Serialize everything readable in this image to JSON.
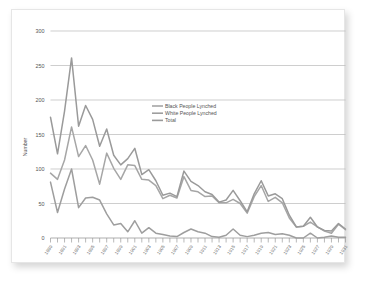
{
  "chart_data": {
    "type": "line",
    "title": "",
    "xlabel": "",
    "ylabel": "Number",
    "ylim": [
      0,
      300
    ],
    "yticks": [
      0,
      50,
      100,
      150,
      200,
      250,
      300
    ],
    "grid": true,
    "legend_position": "upper-center",
    "x": [
      1889,
      1890,
      1891,
      1892,
      1893,
      1894,
      1895,
      1896,
      1897,
      1898,
      1899,
      1900,
      1901,
      1902,
      1903,
      1904,
      1905,
      1906,
      1907,
      1908,
      1909,
      1910,
      1911,
      1912,
      1913,
      1914,
      1915,
      1916,
      1917,
      1918,
      1919,
      1920,
      1921,
      1922,
      1923,
      1924,
      1925,
      1926,
      1927,
      1928,
      1929,
      1930,
      1931
    ],
    "xtick_labels": [
      "1889",
      "1891",
      "1893",
      "1895",
      "1897",
      "1899",
      "1901",
      "1903",
      "1905",
      "1907",
      "1909",
      "1911",
      "1913",
      "1915",
      "1917",
      "1919",
      "1921",
      "1923",
      "1925",
      "1927",
      "1929",
      "1931"
    ],
    "series": [
      {
        "name": "Black People Lynched",
        "color": "#a6a6a6",
        "values": [
          94,
          85,
          113,
          161,
          118,
          134,
          113,
          78,
          123,
          101,
          85,
          106,
          105,
          85,
          84,
          76,
          57,
          62,
          58,
          89,
          69,
          67,
          60,
          61,
          51,
          51,
          56,
          50,
          36,
          60,
          76,
          53,
          59,
          51,
          29,
          16,
          17,
          23,
          16,
          10,
          7,
          20,
          12
        ]
      },
      {
        "name": "White People Lynched",
        "color": "#9e9e9e",
        "values": [
          81,
          37,
          71,
          100,
          44,
          58,
          59,
          55,
          35,
          19,
          21,
          9,
          25,
          7,
          15,
          7,
          5,
          3,
          2,
          8,
          13,
          9,
          7,
          2,
          1,
          4,
          13,
          4,
          2,
          4,
          7,
          8,
          5,
          6,
          4,
          0,
          0,
          7,
          0,
          1,
          3,
          1,
          1
        ]
      },
      {
        "name": "Total",
        "color": "#9a9a9a",
        "values": [
          175,
          122,
          184,
          261,
          162,
          192,
          172,
          133,
          158,
          120,
          106,
          115,
          130,
          92,
          99,
          83,
          62,
          65,
          60,
          97,
          82,
          76,
          67,
          63,
          52,
          55,
          69,
          54,
          38,
          64,
          83,
          61,
          64,
          57,
          33,
          16,
          17,
          30,
          16,
          11,
          10,
          21,
          13
        ]
      }
    ]
  },
  "legend": {
    "items": [
      {
        "label": "Black People Lynched"
      },
      {
        "label": "White People Lynched"
      },
      {
        "label": "Total"
      }
    ]
  },
  "axes": {
    "y_title": "Number",
    "y_ticks": [
      "300",
      "250",
      "200",
      "150",
      "100",
      "50",
      "0"
    ]
  }
}
